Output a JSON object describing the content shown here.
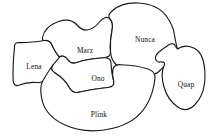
{
  "figure": {
    "background_color": "#ffffff",
    "stroke_color": "#1a1a1a",
    "label_color": "#101010",
    "width": 217,
    "height": 138
  },
  "regions": [
    {
      "id": "lena",
      "label": "Lena",
      "label_x": 34,
      "label_y": 67,
      "path": "M 14.5 47.5 C 14 44 16 42.5 19 42.5 C 26 42.8 38 41.5 44.5 40.5 C 48 40 50.5 41.5 52 45 C 54.5 50.5 56.5 54 59.5 57 C 62.5 60 62.5 62.5 59 64.5 C 54 67.5 49.5 72 46.5 77.5 C 44.5 81.5 41.5 83 37 82.5 C 30 82 24 83 19.5 85 C 16 86.5 13.5 85 13.2 81 C 12.8 73 13.2 60 14.5 47.5 Z"
    },
    {
      "id": "marz",
      "label": "Marz",
      "label_x": 85,
      "label_y": 51,
      "path": "M 52 45 C 50.5 41.5 48 40 44.5 40.5 C 43 40.7 42 39.5 42.5 37.5 C 44 30.5 50 24.5 58.5 21.5 C 66 19 72.5 20 76.5 24.5 C 80 28.5 83.5 30.5 87 30 C 92 29.3 96 26.5 99.5 22 C 103 17.5 107 16 110 19 C 112.5 21.5 113 25.5 112 30.5 C 110.5 38 110 45 110.5 51.5 C 110.8 55.5 108.5 57.5 104 57.8 C 94 58.5 84 60 77 62.5 C 73 64 70 63 68 60 C 65 55.5 61.5 55.5 59.5 57 C 56.5 54 54.5 50.5 52 45 Z"
    },
    {
      "id": "nunca",
      "label": "Nunca",
      "label_x": 145,
      "label_y": 40,
      "path": "M 112 30.5 C 113 25.5 112.5 21.5 110 19 C 108 17 108.5 14 112 11 C 118 5.5 128 2.5 138.5 3 C 151 3.6 161 8.5 167 17 C 170.5 22 173 27 174 32.5 C 175 38.5 176 44 177.5 49 C 178.8 53.5 177.5 57 173.5 59.5 C 168 63 163 67 159.5 71 C 157 73.8 154 74.5 151 73 C 145 70 137.5 68.5 129 68.5 C 123 68.5 118.5 67 115.5 64 C 112.5 61 110.8 57 110.5 51.5 C 110 45 110.5 38 112 30.5 Z"
    },
    {
      "id": "ono",
      "label": "Ono",
      "label_x": 98,
      "label_y": 79,
      "path": "M 59.5 57 C 61.5 55.5 65 55.5 68 60 C 70 63 73 64 77 62.5 C 84 60 94 58.5 104 57.8 C 108.5 57.5 110.8 59.5 111 63 C 111.3 69 112 75 113.5 80 C 114.8 84.5 113 87 108 87.5 C 98 88.5 88 90 80 92 C 75 93.3 71.5 92 69.5 88 C 66.5 82 61.5 77 55 73 C 51 70.5 50.5 68 53 65 C 55 62.6 57.5 60 59.5 57 Z"
    },
    {
      "id": "plink",
      "label": "Plink",
      "label_x": 99,
      "label_y": 115,
      "path": "M 53 65 C 50.5 68 51 70.5 55 73 C 61.5 77 66.5 82 69.5 88 C 71.5 92 75 93.3 80 92 C 88 90 98 88.5 108 87.5 C 113 87 114.8 84.5 113.5 80 C 112.3 76 112.2 72 113 69 C 113.8 66 116.5 64.5 121 64.7 C 130 65 140.5 66.5 148 69 C 153 70.7 155.5 73.5 155 78 C 154 88 151 98 146 106 C 139 117.5 127 125 112 128.5 C 95 132.5 78 131 64 124.5 C 51 118.5 43.5 109 41.5 97.5 C 40.2 90 40.5 85 42.5 81.5 C 44.8 77.5 48 71.5 53 65 Z"
    },
    {
      "id": "quap",
      "label": "Quap",
      "label_x": 186,
      "label_y": 85,
      "path": "M 177.5 49 C 181 46.5 185 45.5 189.5 46.5 C 196.5 48 201 52.5 203 60 C 205 67.5 205.5 75.5 204.5 83.5 C 203.5 92 200 99.5 194.5 105 C 189.5 110 184 111 178.5 107.5 C 171.5 103 166.5 96 164 87 C 161.5 78 161.5 71 164 66 C 165.5 63 164 61.5 160.5 62 C 158 62.4 156 61 155.5 58.5 C 155 56 156.5 54 159.5 51.5 C 162.5 49 165.5 47 168.5 45 C 171.5 43 174.5 43.5 175.5 46 C 176.2 47.5 176.8 48.5 177.5 49 Z"
    }
  ]
}
